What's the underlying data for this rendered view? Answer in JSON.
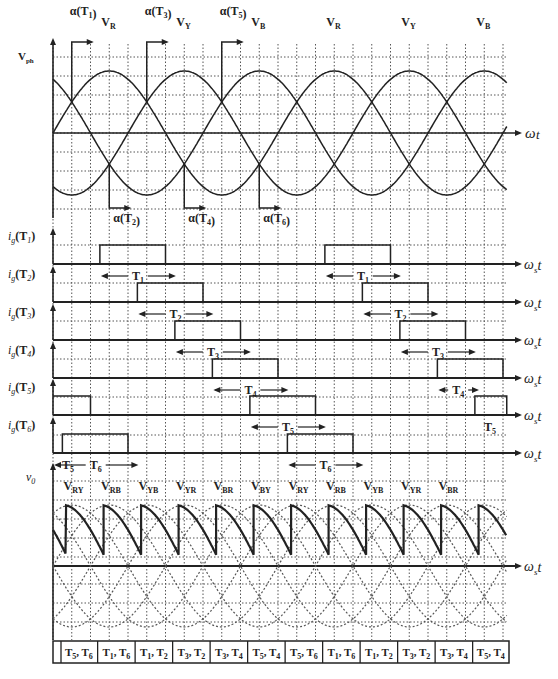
{
  "diagram": {
    "x_axis_label": "ω_s t",
    "colors": {
      "line": "#222222",
      "grid": "#555555",
      "background": "#ffffff"
    }
  },
  "phase_panel": {
    "y_axis_label": "V_ph",
    "phase_labels": [
      {
        "text": "V",
        "sub": "R",
        "theta": 90
      },
      {
        "text": "V",
        "sub": "Y",
        "theta": 210
      },
      {
        "text": "V",
        "sub": "B",
        "theta": 330
      },
      {
        "text": "V",
        "sub": "R",
        "theta": 450
      },
      {
        "text": "V",
        "sub": "Y",
        "theta": 570
      },
      {
        "text": "V",
        "sub": "B",
        "theta": 690
      }
    ],
    "firing_markers_top": [
      {
        "label": "α(T",
        "sub": "1",
        "theta": 30
      },
      {
        "label": "α(T",
        "sub": "3",
        "theta": 150
      },
      {
        "label": "α(T",
        "sub": "5",
        "theta": 270
      }
    ],
    "firing_markers_bottom": [
      {
        "label": "α(T",
        "sub": "2",
        "theta": 90
      },
      {
        "label": "α(T",
        "sub": "4",
        "theta": 210
      },
      {
        "label": "α(T",
        "sub": "6",
        "theta": 330
      }
    ]
  },
  "gate_panel": {
    "rows": [
      {
        "label": "i",
        "sub": "g",
        "thyristor": "(T",
        "tsub": "1",
        "pulses": [
          [
            75,
            180
          ],
          [
            435,
            540
          ]
        ],
        "spans": [
          {
            "from": 75,
            "to": 195,
            "label": "T",
            "sub": "1"
          },
          {
            "from": 435,
            "to": 555,
            "label": "T",
            "sub": "1"
          }
        ]
      },
      {
        "label": "i",
        "sub": "g",
        "thyristor": "(T",
        "tsub": "2",
        "pulses": [
          [
            135,
            240
          ],
          [
            495,
            600
          ]
        ],
        "spans": [
          {
            "from": 135,
            "to": 255,
            "label": "T",
            "sub": "2"
          },
          {
            "from": 495,
            "to": 615,
            "label": "T",
            "sub": "2"
          }
        ]
      },
      {
        "label": "i",
        "sub": "g",
        "thyristor": "(T",
        "tsub": "3",
        "pulses": [
          [
            195,
            300
          ],
          [
            555,
            660
          ]
        ],
        "spans": [
          {
            "from": 195,
            "to": 315,
            "label": "T",
            "sub": "3"
          },
          {
            "from": 555,
            "to": 675,
            "label": "T",
            "sub": "3"
          }
        ]
      },
      {
        "label": "i",
        "sub": "g",
        "thyristor": "(T",
        "tsub": "4",
        "pulses": [
          [
            255,
            360
          ],
          [
            615,
            720
          ]
        ],
        "spans": [
          {
            "from": 255,
            "to": 375,
            "label": "T",
            "sub": "4"
          },
          {
            "from": 615,
            "to": 680,
            "label": "T",
            "sub": "4"
          }
        ]
      },
      {
        "label": "i",
        "sub": "g",
        "thyristor": "(T",
        "tsub": "5",
        "pulses": [
          [
            0,
            60
          ],
          [
            315,
            420
          ],
          [
            675,
            726
          ]
        ],
        "spans": [
          {
            "from": 315,
            "to": 435,
            "label": "T",
            "sub": "5"
          },
          {
            "from": 675,
            "to": 726,
            "label": "T",
            "sub": "5",
            "text_only": true
          }
        ]
      },
      {
        "label": "i",
        "sub": "g",
        "thyristor": "(T",
        "tsub": "6",
        "pulses": [
          [
            15,
            120
          ],
          [
            375,
            480
          ]
        ],
        "spans": [
          {
            "from": 0,
            "to": 40,
            "label": "T",
            "sub": "5",
            "text_only": true
          },
          {
            "from": 0,
            "to": 135,
            "label": "T",
            "sub": "6",
            "next_row": true
          },
          {
            "from": 375,
            "to": 495,
            "label": "T",
            "sub": "6",
            "next_row": true
          }
        ]
      }
    ]
  },
  "output_panel": {
    "y_axis_label": "v",
    "y_axis_sub": "0",
    "line_labels": [
      {
        "text": "V",
        "sub": "RY"
      },
      {
        "text": "V",
        "sub": "RB"
      },
      {
        "text": "V",
        "sub": "YB"
      },
      {
        "text": "V",
        "sub": "YR"
      },
      {
        "text": "V",
        "sub": "BR"
      },
      {
        "text": "V",
        "sub": "BY"
      },
      {
        "text": "V",
        "sub": "RY"
      },
      {
        "text": "V",
        "sub": "RB"
      },
      {
        "text": "V",
        "sub": "YB"
      },
      {
        "text": "V",
        "sub": "YR"
      },
      {
        "text": "V",
        "sub": "BR"
      }
    ]
  },
  "conduction_table": {
    "cells": [
      "T5, T6",
      "T1, T6",
      "T1, T2",
      "T3, T2",
      "T3, T4",
      "T5, T4",
      "T5, T6",
      "T1, T6",
      "T1, T2",
      "T3, T2",
      "T3, T4",
      "T5, T4"
    ]
  }
}
